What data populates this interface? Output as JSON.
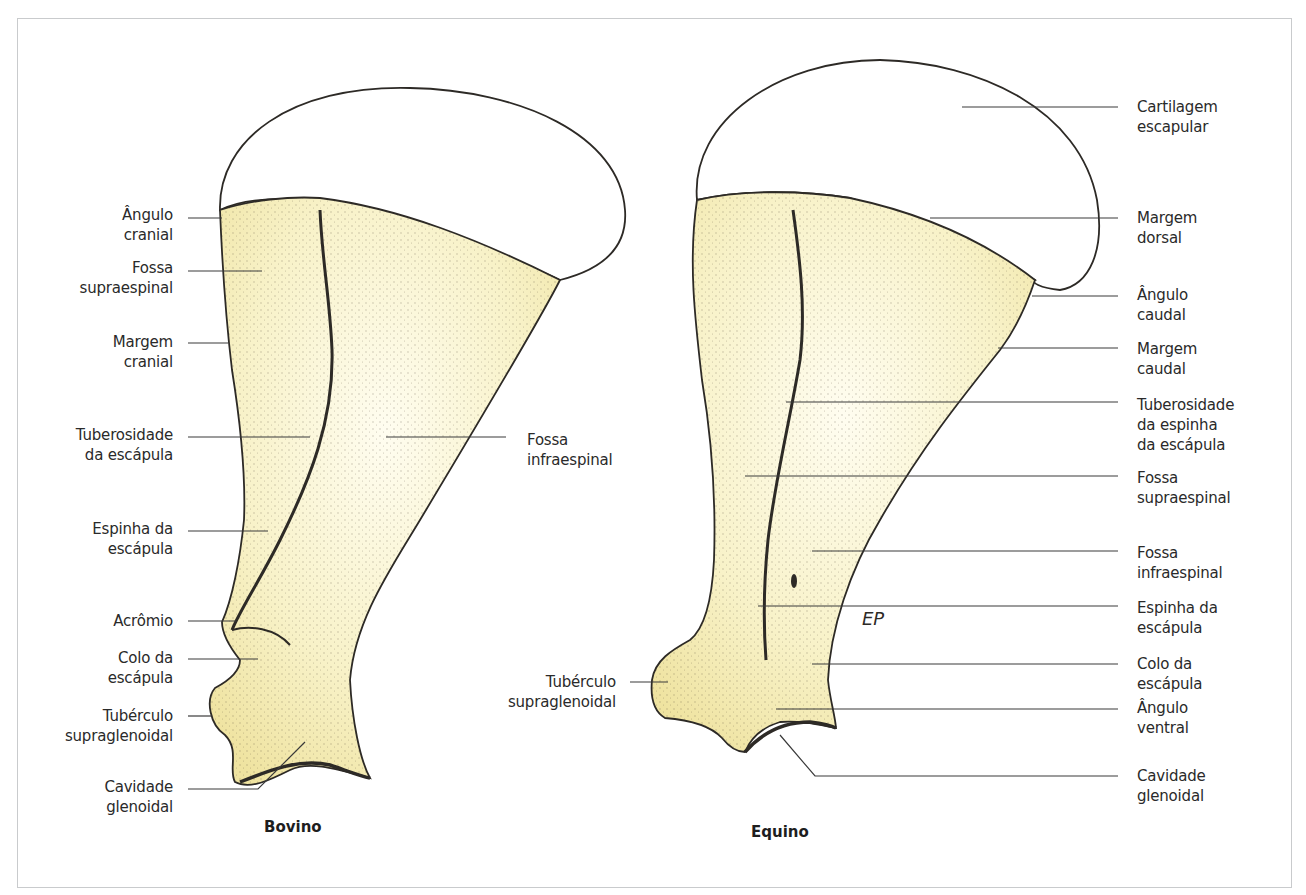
{
  "figure": {
    "colors": {
      "bone_fill": "#f8f2c8",
      "bone_shade": "#efe3a0",
      "outline": "#2d2a26",
      "leader_line": "#3a3a3a",
      "frame_border": "#c9cbcd"
    },
    "bovino": {
      "caption": "Bovino",
      "labels": [
        {
          "text": "Ângulo\ncranial"
        },
        {
          "text": "Fossa\nsupraespinal"
        },
        {
          "text": "Margem\ncranial"
        },
        {
          "text": "Tuberosidade\nda escápula"
        },
        {
          "text": "Espinha da\nescápula"
        },
        {
          "text": "Acrômio"
        },
        {
          "text": "Colo da\nescápula"
        },
        {
          "text": "Tubérculo\nsupraglenoidal"
        },
        {
          "text": "Cavidade\nglenoidal"
        },
        {
          "text": "Fossa\ninfraespinal"
        }
      ]
    },
    "equino": {
      "caption": "Equino",
      "signature": "EP",
      "left_labels": [
        {
          "text": "Tubérculo\nsupraglenoidal"
        }
      ],
      "labels": [
        {
          "text": "Cartilagem\nescapular"
        },
        {
          "text": "Margem\ndorsal"
        },
        {
          "text": "Ângulo\ncaudal"
        },
        {
          "text": "Margem\ncaudal"
        },
        {
          "text": "Tuberosidade\nda espinha\nda escápula"
        },
        {
          "text": "Fossa\nsupraespinal"
        },
        {
          "text": "Fossa\ninfraespinal"
        },
        {
          "text": "Espinha da\nescápula"
        },
        {
          "text": "Colo da\nescápula"
        },
        {
          "text": "Ângulo\nventral"
        },
        {
          "text": "Cavidade\nglenoidal"
        }
      ]
    }
  }
}
